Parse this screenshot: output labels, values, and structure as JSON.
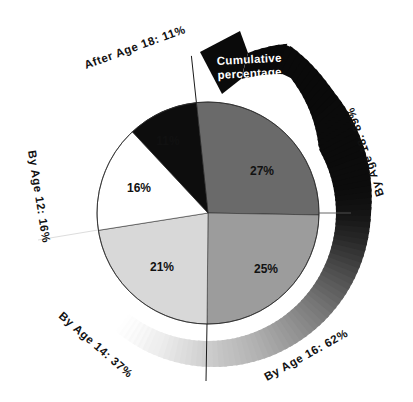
{
  "page": {
    "background": "#ffffff"
  },
  "chart_data": {
    "type": "pie",
    "title": "Cumulative percentage",
    "unit": "%",
    "slices": [
      {
        "label": "27%",
        "value": 27,
        "color": "#6a6a6a",
        "label_color": "#0e0e0e",
        "outer_label": "By Age 18: 89%",
        "cumulative_pct": 89
      },
      {
        "label": "25%",
        "value": 25,
        "color": "#9c9c9c",
        "label_color": "#0e0e0e",
        "outer_label": "By Age 16: 62%",
        "cumulative_pct": 62
      },
      {
        "label": "21%",
        "value": 21,
        "color": "#d8d8d8",
        "label_color": "#0e0e0e",
        "outer_label": "By Age 14: 37%",
        "cumulative_pct": 37
      },
      {
        "label": "16%",
        "value": 16,
        "color": "#ffffff",
        "label_color": "#0e0e0e",
        "outer_label": "By Age 12: 16%",
        "cumulative_pct": 16
      },
      {
        "label": "11%",
        "value": 11,
        "color": "#0d0d0d",
        "label_color": "#ffffff",
        "outer_label": "After Age 18: 11%",
        "cumulative_pct": 100
      }
    ],
    "arrow": {
      "line1": "Cumulative",
      "line2": "percentage",
      "text_color": "#ffffff",
      "direction": "counterclockwise",
      "gradient_start": "#f6f6f6",
      "gradient_end": "#0a0a0a"
    },
    "layout": {
      "center": [
        208,
        213
      ],
      "radius": 111,
      "boundaries_deg": [
        -6,
        91,
        180.5,
        261,
        317
      ],
      "label_pos": [
        [
          262,
          171
        ],
        [
          266,
          269
        ],
        [
          162,
          267
        ],
        [
          139,
          188
        ],
        [
          168,
          141
        ]
      ],
      "ring": {
        "tail_deg": 218,
        "head_deg": 14,
        "segments": 96
      },
      "gray_stops": [
        [
          218,
          248
        ],
        [
          200,
          238
        ],
        [
          185,
          214
        ],
        [
          175,
          198
        ],
        [
          160,
          178
        ],
        [
          145,
          150
        ],
        [
          130,
          118
        ],
        [
          115,
          80
        ],
        [
          100,
          40
        ],
        [
          90,
          20
        ],
        [
          80,
          12
        ],
        [
          14,
          9
        ]
      ]
    }
  }
}
